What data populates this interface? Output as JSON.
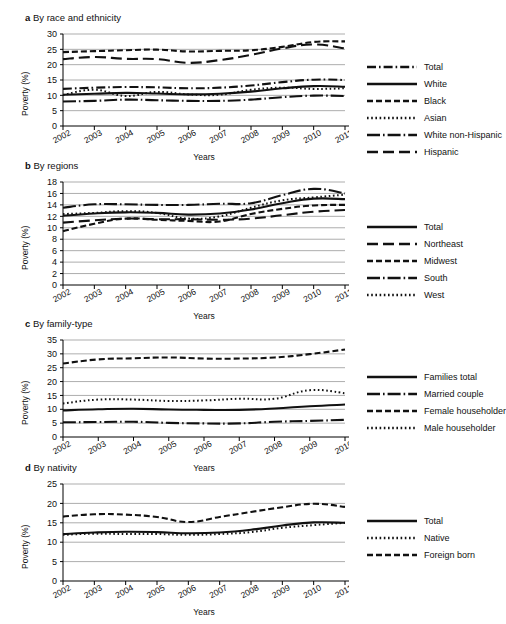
{
  "figure": {
    "axis_label_y": "Poverty (%)",
    "axis_label_x": "Years"
  },
  "panels": [
    {
      "letter": "a",
      "title": "By race and ethnicity",
      "chart_data": {
        "type": "line",
        "title": "By race and ethnicity",
        "xlabel": "Years",
        "ylabel": "Poverty (%)",
        "xlim": [
          2002,
          2011
        ],
        "ylim": [
          0,
          30
        ],
        "yticks": [
          0,
          5,
          10,
          15,
          20,
          25,
          30
        ],
        "xticks": [
          "2002",
          "2003",
          "2004",
          "2005",
          "2006",
          "2007",
          "2008",
          "2009",
          "2010",
          "2011"
        ],
        "grid": true,
        "legend_position": "right",
        "x": [
          2002,
          2003,
          2004,
          2005,
          2006,
          2007,
          2008,
          2009,
          2010,
          2011
        ],
        "series": [
          {
            "name": "Total",
            "style": "dash-dot",
            "values": [
              12.1,
              12.5,
              12.7,
              12.6,
              12.3,
              12.5,
              13.2,
              14.3,
              15.1,
              15.0
            ]
          },
          {
            "name": "White",
            "style": "solid",
            "values": [
              10.2,
              10.5,
              10.8,
              10.6,
              10.3,
              10.5,
              11.2,
              12.3,
              13.0,
              12.8
            ]
          },
          {
            "name": "Black",
            "style": "dashed",
            "values": [
              24.1,
              24.4,
              24.7,
              24.9,
              24.3,
              24.5,
              24.7,
              25.8,
              27.4,
              27.6
            ]
          },
          {
            "name": "Asian",
            "style": "dotted",
            "values": [
              10.1,
              11.8,
              9.8,
              11.1,
              10.3,
              10.2,
              11.8,
              12.5,
              12.1,
              12.3
            ]
          },
          {
            "name": "White non-Hispanic",
            "style": "solid-dot",
            "values": [
              8.0,
              8.2,
              8.6,
              8.4,
              8.2,
              8.2,
              8.6,
              9.4,
              9.9,
              9.8
            ]
          },
          {
            "name": "Hispanic",
            "style": "long-dash",
            "values": [
              21.8,
              22.5,
              21.9,
              21.8,
              20.6,
              21.5,
              23.2,
              25.3,
              26.6,
              25.3
            ]
          }
        ]
      },
      "legend": [
        {
          "label": "Total",
          "style": "dash-dot"
        },
        {
          "label": "White",
          "style": "solid"
        },
        {
          "label": "Black",
          "style": "dashed"
        },
        {
          "label": "Asian",
          "style": "dotted"
        },
        {
          "label": "White non-Hispanic",
          "style": "solid-dot"
        },
        {
          "label": "Hispanic",
          "style": "long-dash"
        }
      ]
    },
    {
      "letter": "b",
      "title": "By regions",
      "chart_data": {
        "type": "line",
        "title": "By regions",
        "xlabel": "Years",
        "ylabel": "Poverty (%)",
        "xlim": [
          2002,
          2011
        ],
        "ylim": [
          0,
          18
        ],
        "yticks": [
          0,
          2,
          4,
          6,
          8,
          10,
          12,
          14,
          16,
          18
        ],
        "xticks": [
          "2002",
          "2003",
          "2004",
          "2005",
          "2006",
          "2007",
          "2008",
          "2009",
          "2010",
          "2011"
        ],
        "grid": true,
        "legend_position": "right",
        "x": [
          2002,
          2003,
          2004,
          2005,
          2006,
          2007,
          2008,
          2009,
          2010,
          2011
        ],
        "series": [
          {
            "name": "Total",
            "style": "solid",
            "values": [
              12.1,
              12.5,
              12.7,
              12.6,
              12.3,
              12.5,
              13.2,
              14.3,
              15.1,
              15.0
            ]
          },
          {
            "name": "Northeast",
            "style": "long-dash",
            "values": [
              10.9,
              11.3,
              11.6,
              11.5,
              11.5,
              11.4,
              11.6,
              12.2,
              12.8,
              13.1
            ]
          },
          {
            "name": "Midwest",
            "style": "dashed",
            "values": [
              9.4,
              10.7,
              11.6,
              11.4,
              11.2,
              11.1,
              12.4,
              13.3,
              13.9,
              14.0
            ]
          },
          {
            "name": "South",
            "style": "solid-dot",
            "values": [
              13.5,
              14.1,
              14.1,
              14.0,
              14.0,
              14.2,
              14.3,
              15.7,
              16.8,
              16.0
            ]
          },
          {
            "name": "West",
            "style": "dotted",
            "values": [
              12.4,
              12.6,
              12.9,
              12.6,
              11.6,
              12.0,
              13.5,
              14.8,
              15.3,
              15.8
            ]
          }
        ]
      },
      "legend": [
        {
          "label": "Total",
          "style": "solid"
        },
        {
          "label": "Northeast",
          "style": "long-dash"
        },
        {
          "label": "Midwest",
          "style": "dashed"
        },
        {
          "label": "South",
          "style": "solid-dot"
        },
        {
          "label": "West",
          "style": "dotted"
        }
      ]
    },
    {
      "letter": "c",
      "title": "By family-type",
      "chart_data": {
        "type": "line",
        "title": "By family-type",
        "xlabel": "Years",
        "ylabel": "Poverty (%)",
        "xlim": [
          2002,
          2010
        ],
        "ylim": [
          0,
          35
        ],
        "yticks": [
          0,
          5,
          10,
          15,
          20,
          25,
          30,
          35
        ],
        "xticks": [
          "2002",
          "2003",
          "2004",
          "2005",
          "2006",
          "2007",
          "2008",
          "2009",
          "2010"
        ],
        "grid": true,
        "legend_position": "right",
        "x": [
          2002,
          2003,
          2004,
          2005,
          2006,
          2007,
          2008,
          2009,
          2010
        ],
        "series": [
          {
            "name": "Families total",
            "style": "solid",
            "values": [
              9.6,
              10.0,
              10.2,
              9.9,
              9.8,
              9.8,
              10.3,
              11.1,
              11.7
            ]
          },
          {
            "name": "Married couple",
            "style": "solid-dot",
            "values": [
              5.3,
              5.4,
              5.5,
              5.1,
              4.9,
              4.9,
              5.5,
              5.8,
              6.2
            ]
          },
          {
            "name": "Female householder",
            "style": "dashed",
            "values": [
              26.5,
              28.0,
              28.4,
              28.7,
              28.3,
              28.3,
              28.7,
              29.9,
              31.6
            ]
          },
          {
            "name": "Male householder",
            "style": "dotted",
            "values": [
              12.1,
              13.5,
              13.5,
              13.0,
              13.2,
              13.8,
              13.8,
              16.9,
              15.8
            ]
          }
        ]
      },
      "legend": [
        {
          "label": "Families total",
          "style": "solid"
        },
        {
          "label": "Married couple",
          "style": "solid-dot"
        },
        {
          "label": "Female householder",
          "style": "dashed"
        },
        {
          "label": "Male householder",
          "style": "dotted"
        }
      ]
    },
    {
      "letter": "d",
      "title": "By nativity",
      "chart_data": {
        "type": "line",
        "title": "By nativity",
        "xlabel": "Years",
        "ylabel": "Poverty (%)",
        "xlim": [
          2002,
          2011
        ],
        "ylim": [
          0,
          25
        ],
        "yticks": [
          0,
          5,
          10,
          15,
          20,
          25
        ],
        "xticks": [
          "2002",
          "2003",
          "2004",
          "2005",
          "2006",
          "2007",
          "2008",
          "2009",
          "2010",
          "2011"
        ],
        "grid": true,
        "legend_position": "right",
        "x": [
          2002,
          2003,
          2004,
          2005,
          2006,
          2007,
          2008,
          2009,
          2010,
          2011
        ],
        "series": [
          {
            "name": "Total",
            "style": "solid",
            "values": [
              12.1,
              12.5,
              12.7,
              12.6,
              12.3,
              12.5,
              13.2,
              14.3,
              15.1,
              15.0
            ]
          },
          {
            "name": "Native",
            "style": "dotted",
            "values": [
              11.9,
              12.2,
              12.1,
              12.1,
              11.9,
              12.1,
              12.6,
              13.7,
              14.4,
              15.0
            ]
          },
          {
            "name": "Foreign born",
            "style": "dashed",
            "values": [
              16.6,
              17.2,
              17.1,
              16.5,
              15.2,
              16.5,
              17.8,
              19.0,
              19.9,
              19.1
            ]
          }
        ]
      },
      "legend": [
        {
          "label": "Total",
          "style": "solid"
        },
        {
          "label": "Native",
          "style": "dotted"
        },
        {
          "label": "Foreign born",
          "style": "dashed"
        }
      ]
    }
  ]
}
